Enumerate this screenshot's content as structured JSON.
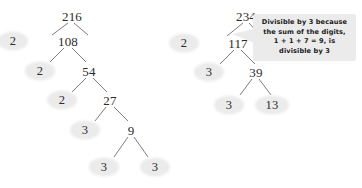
{
  "figure": {
    "background_color": "#ffffff",
    "node_text_color": "#2b2b2b",
    "leaf_fill_color": "#ebebeb",
    "branch_color": "#6e6e6e",
    "callout_fill_color": "#ebebeb"
  },
  "trees": [
    {
      "id": "factor-tree-216",
      "root_value": "216",
      "nodes": [
        {
          "key": "root",
          "label": "216",
          "kind": "composite",
          "x": 72,
          "y": 16
        },
        {
          "key": "p1",
          "label": "2",
          "kind": "prime",
          "x": 13,
          "y": 41
        },
        {
          "key": "c1",
          "label": "108",
          "kind": "composite",
          "x": 68,
          "y": 41
        },
        {
          "key": "p2",
          "label": "2",
          "kind": "prime",
          "x": 40,
          "y": 71
        },
        {
          "key": "c2",
          "label": "54",
          "kind": "composite",
          "x": 89,
          "y": 71
        },
        {
          "key": "p3",
          "label": "2",
          "kind": "prime",
          "x": 62,
          "y": 100
        },
        {
          "key": "c3",
          "label": "27",
          "kind": "composite",
          "x": 110,
          "y": 100
        },
        {
          "key": "p4",
          "label": "3",
          "kind": "prime",
          "x": 85,
          "y": 130
        },
        {
          "key": "c4",
          "label": "9",
          "kind": "composite",
          "x": 131,
          "y": 130
        },
        {
          "key": "p5",
          "label": "3",
          "kind": "prime",
          "x": 104,
          "y": 167
        },
        {
          "key": "p6",
          "label": "3",
          "kind": "prime",
          "x": 155,
          "y": 167
        }
      ],
      "branches": [
        {
          "x1": 68,
          "y1": 23,
          "x2": 52,
          "y2": 35
        },
        {
          "x1": 74,
          "y1": 23,
          "x2": 88,
          "y2": 35
        },
        {
          "x1": 64,
          "y1": 48,
          "x2": 50,
          "y2": 62
        },
        {
          "x1": 72,
          "y1": 48,
          "x2": 86,
          "y2": 62
        },
        {
          "x1": 86,
          "y1": 78,
          "x2": 72,
          "y2": 92
        },
        {
          "x1": 93,
          "y1": 78,
          "x2": 107,
          "y2": 92
        },
        {
          "x1": 106,
          "y1": 107,
          "x2": 95,
          "y2": 121
        },
        {
          "x1": 114,
          "y1": 107,
          "x2": 128,
          "y2": 121
        },
        {
          "x1": 128,
          "y1": 137,
          "x2": 114,
          "y2": 157
        },
        {
          "x1": 134,
          "y1": 137,
          "x2": 148,
          "y2": 157
        }
      ]
    },
    {
      "id": "factor-tree-234",
      "root_value": "234",
      "nodes": [
        {
          "key": "root",
          "label": "234",
          "kind": "composite",
          "x": 246,
          "y": 16
        },
        {
          "key": "p1",
          "label": "2",
          "kind": "prime",
          "x": 184,
          "y": 43
        },
        {
          "key": "c1",
          "label": "117",
          "kind": "composite",
          "x": 238,
          "y": 43
        },
        {
          "key": "p2",
          "label": "3",
          "kind": "prime",
          "x": 209,
          "y": 72
        },
        {
          "key": "c2",
          "label": "39",
          "kind": "composite",
          "x": 256,
          "y": 72
        },
        {
          "key": "p3",
          "label": "3",
          "kind": "prime",
          "x": 229,
          "y": 105
        },
        {
          "key": "p4",
          "label": "13",
          "kind": "prime",
          "x": 272,
          "y": 105
        }
      ],
      "branches": [
        {
          "x1": 243,
          "y1": 23,
          "x2": 227,
          "y2": 36
        },
        {
          "x1": 249,
          "y1": 23,
          "x2": 261,
          "y2": 36
        },
        {
          "x1": 234,
          "y1": 50,
          "x2": 220,
          "y2": 64
        },
        {
          "x1": 241,
          "y1": 50,
          "x2": 255,
          "y2": 64
        },
        {
          "x1": 252,
          "y1": 79,
          "x2": 240,
          "y2": 95
        },
        {
          "x1": 259,
          "y1": 79,
          "x2": 271,
          "y2": 95
        }
      ]
    }
  ],
  "callout": {
    "id": "divisibility-note",
    "lines": [
      "Divisible by 3 because",
      "the sum of the digits,",
      "1 + 1 + 7 = 9, is",
      "divisible by 3"
    ],
    "points_to": "117"
  }
}
